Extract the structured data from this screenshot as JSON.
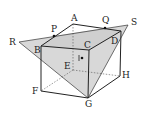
{
  "diagram": {
    "type": "cube-section",
    "colors": {
      "edge": "#333333",
      "fill": "#d8d8d8",
      "hidden": "#555555",
      "background": "#ffffff"
    },
    "labels": {
      "A": "A",
      "B": "B",
      "C": "C",
      "D": "D",
      "E": "E",
      "F": "F",
      "G": "G",
      "H": "H",
      "P": "P",
      "Q": "Q",
      "R": "R",
      "S": "S",
      "I": "I"
    }
  }
}
